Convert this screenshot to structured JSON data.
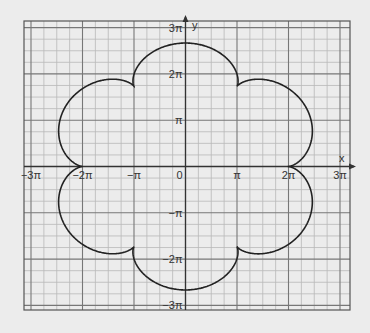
{
  "chart_data": {
    "type": "line",
    "title": "",
    "xlabel": "x",
    "ylabel": "y",
    "xlim": [
      -3.15,
      3.25
    ],
    "ylim": [
      -3.1,
      3.1
    ],
    "units": "pi",
    "grid": true,
    "x_ticks": [
      {
        "value": -3,
        "label": "−3π"
      },
      {
        "value": -2,
        "label": "−2π"
      },
      {
        "value": -1,
        "label": "−π"
      },
      {
        "value": 0,
        "label": "0"
      },
      {
        "value": 1,
        "label": "π"
      },
      {
        "value": 2,
        "label": "2π"
      },
      {
        "value": 3,
        "label": "3π"
      }
    ],
    "y_ticks": [
      {
        "value": 3,
        "label": "3π"
      },
      {
        "value": 2,
        "label": "2π"
      },
      {
        "value": 1,
        "label": "π"
      },
      {
        "value": -1,
        "label": "−π"
      },
      {
        "value": -2,
        "label": "−2π"
      },
      {
        "value": -3,
        "label": "−3π"
      }
    ],
    "series": [
      {
        "name": "epicycloid",
        "description": "x = (7π/3)cos t − (π/3)cos 7t, y = (7π/3)sin t − (π/3)sin 7t, 6 cusps",
        "R": 2,
        "r": 0.3333,
        "cusps": [
          [
            2,
            0
          ],
          [
            1,
            1.732
          ],
          [
            -1,
            1.732
          ],
          [
            -2,
            0
          ],
          [
            -1,
            -1.732
          ],
          [
            1,
            -1.732
          ]
        ],
        "max_radius": 2.667,
        "color": "#222222"
      }
    ]
  },
  "axes": {
    "x_name": "x",
    "y_name": "y"
  }
}
